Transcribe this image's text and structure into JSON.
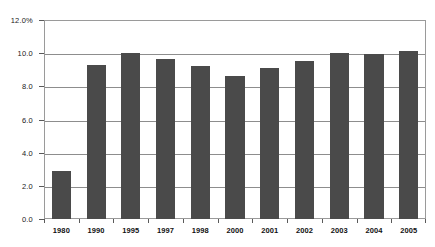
{
  "chart_data": {
    "type": "bar",
    "title": "",
    "subtitle": "",
    "xlabel": "",
    "ylabel": "",
    "categories": [
      "1980",
      "1990",
      "1995",
      "1997",
      "1998",
      "2000",
      "2001",
      "2002",
      "2003",
      "2004",
      "2005"
    ],
    "values": [
      2.9,
      9.3,
      10.0,
      9.65,
      9.2,
      8.6,
      9.1,
      9.5,
      10.0,
      9.95,
      10.15
    ],
    "ylim": [
      0.0,
      12.0
    ],
    "ytick_values": [
      0.0,
      2.0,
      4.0,
      6.0,
      8.0,
      10.0,
      12.0
    ],
    "ytick_labels": [
      "0.0",
      "2.0",
      "4.0",
      "6.0",
      "8.0",
      "10.0",
      "12.0%"
    ],
    "grid": true,
    "grid_axis": "y",
    "legend": false,
    "legend_position": "none",
    "annotations": [],
    "series": [
      {
        "name": "",
        "values": [
          2.9,
          9.3,
          10.0,
          9.65,
          9.2,
          8.6,
          9.1,
          9.5,
          10.0,
          9.95,
          10.15
        ]
      }
    ]
  },
  "style": {
    "bar_color": "#4a4a4a",
    "grid_color": "#8d8d8d",
    "frame_color": "#9a9a9a",
    "text_color": "#111111",
    "background": "#ffffff"
  }
}
